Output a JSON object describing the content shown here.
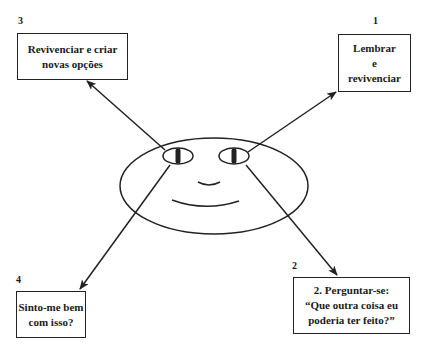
{
  "diagram": {
    "title": "",
    "center_figure": "smiling-face",
    "steps": [
      {
        "number": "1",
        "lines": [
          "Lembrar",
          "e",
          "revivenciar"
        ]
      },
      {
        "number": "2",
        "lines": [
          "2. Perguntar-se:",
          "“Que outra coisa eu",
          "poderia ter feito?”"
        ]
      },
      {
        "number": "3",
        "lines": [
          "Revivenciar e criar",
          "novas opções"
        ]
      },
      {
        "number": "4",
        "lines": [
          "Sinto-me bem",
          "com isso?"
        ]
      }
    ],
    "colors": {
      "stroke": "#222222",
      "background": "#ffffff",
      "text": "#1a1a1a"
    }
  }
}
